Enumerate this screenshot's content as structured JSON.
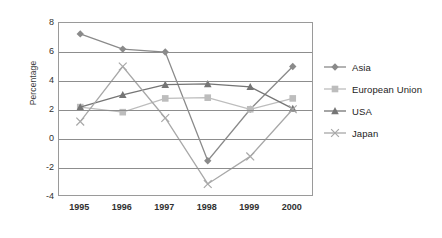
{
  "chart_data": {
    "type": "line",
    "title": "",
    "xlabel": "",
    "ylabel": "Percentage",
    "categories": [
      "1995",
      "1996",
      "1997",
      "1998",
      "1999",
      "2000"
    ],
    "ylim": [
      -4,
      8
    ],
    "yticks": [
      8,
      6,
      4,
      2,
      0,
      -2,
      -4
    ],
    "ytick_labels": [
      "8",
      "6",
      "4",
      "2",
      "0",
      "-2",
      "-4"
    ],
    "grid": true,
    "legend_position": "right",
    "series": [
      {
        "name": "Asia",
        "marker": "diamond",
        "color": "#8a8a8a",
        "values": [
          7.25,
          6.2,
          6.0,
          -1.5,
          2.05,
          5.0
        ]
      },
      {
        "name": "European Union",
        "marker": "square",
        "color": "#bdbdbd",
        "values": [
          2.2,
          1.85,
          2.8,
          2.85,
          2.05,
          2.8
        ]
      },
      {
        "name": "USA",
        "marker": "triangle",
        "color": "#757575",
        "values": [
          2.2,
          3.05,
          3.75,
          3.8,
          3.6,
          2.1
        ]
      },
      {
        "name": "Japan",
        "marker": "cross",
        "color": "#a8a8a8",
        "values": [
          1.2,
          5.0,
          1.45,
          -3.1,
          -1.2,
          2.05
        ]
      }
    ]
  },
  "legend": {
    "items": [
      {
        "label": "Asia"
      },
      {
        "label": "European Union"
      },
      {
        "label": "USA"
      },
      {
        "label": "Japan"
      }
    ]
  },
  "colors": {
    "axis": "#9a9a9a",
    "grid": "#8d8d8d",
    "text": "#303030",
    "asia": "#8a8a8a",
    "european_union": "#bdbdbd",
    "usa": "#757575",
    "japan": "#a8a8a8"
  }
}
